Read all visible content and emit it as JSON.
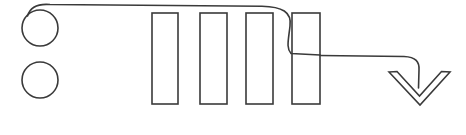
{
  "canvas": {
    "width": 466,
    "height": 135,
    "background_color": "#ffffff",
    "stroke_color": "#3a3a3a",
    "stroke_width": 1.6,
    "style": "hand-drawn line art, black outline on white, no text labels"
  },
  "diagram": {
    "title": "",
    "shapes": [
      {
        "id": "circle-top",
        "name": "circle-top",
        "type": "circle",
        "cx": 40,
        "cy": 28,
        "r": 18,
        "fill": "none",
        "stroke": "#3a3a3a"
      },
      {
        "id": "circle-bottom",
        "name": "circle-bottom",
        "type": "circle",
        "cx": 40,
        "cy": 80,
        "r": 18,
        "fill": "none",
        "stroke": "#3a3a3a"
      },
      {
        "id": "bar-1",
        "name": "vertical-bar-1",
        "type": "rect",
        "x": 152,
        "y": 13,
        "width": 26,
        "height": 91,
        "fill": "none",
        "stroke": "#3a3a3a"
      },
      {
        "id": "bar-2",
        "name": "vertical-bar-2",
        "type": "rect",
        "x": 200,
        "y": 13,
        "width": 27,
        "height": 91,
        "fill": "none",
        "stroke": "#3a3a3a"
      },
      {
        "id": "bar-3",
        "name": "vertical-bar-3",
        "type": "rect",
        "x": 246,
        "y": 13,
        "width": 27,
        "height": 91,
        "fill": "none",
        "stroke": "#3a3a3a"
      },
      {
        "id": "bar-4",
        "name": "vertical-bar-4",
        "type": "rect",
        "x": 292,
        "y": 13,
        "width": 28,
        "height": 91,
        "fill": "none",
        "stroke": "#3a3a3a"
      }
    ],
    "connectors": [
      {
        "id": "connector-top",
        "name": "top-curve-connector",
        "from": "circle-top",
        "to": "bar-4",
        "path": "M 27.5 16 C 30 7.5 38 3.5 50 4.5 L 262 6.2 C 282 6.6 292 12 290 26 C 288.5 40 286 48 291 53.5 L 320 55",
        "stroke": "#3a3a3a"
      },
      {
        "id": "connector-exit",
        "name": "exit-arrow-connector",
        "from": "bar-4",
        "to": "arrowhead",
        "path": "M 320 55.5 L 404 56.5 C 416 57 419.5 62 419 70 L 418.5 88",
        "stroke": "#3a3a3a"
      }
    ],
    "arrowheads": [
      {
        "id": "arrowhead",
        "name": "chevron-down-arrowhead",
        "type": "chevron-down",
        "path": "M 389 72 L 397 71.5 L 419.5 96 L 441.5 71.5 L 450 72 L 420 105 Z",
        "direction": "down",
        "stroke": "#3a3a3a"
      }
    ]
  }
}
